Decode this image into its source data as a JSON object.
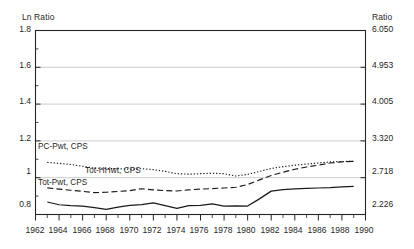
{
  "axes": {
    "left_title": "Ln Ratio",
    "right_title": "Ratio",
    "left_ticks": [
      "1.8",
      "1.6",
      "1.4",
      "1.2",
      "1",
      "0.8"
    ],
    "right_ticks": [
      "6.050",
      "4.953",
      "4.005",
      "3.320",
      "2.718",
      "2.226"
    ],
    "x_ticks": [
      "1962",
      "1964",
      "1966",
      "1968",
      "1970",
      "1972",
      "1974",
      "1976",
      "1978",
      "1980",
      "1982",
      "1984",
      "1986",
      "1988",
      "1990"
    ]
  },
  "series_labels": {
    "pc_pwt": "PC-Pwt, CPS",
    "tot_hhwt": "Tot-HHwt, CPS",
    "tot_pwt": "Tot-Pwt, CPS"
  },
  "chart_data": {
    "type": "line",
    "title": "",
    "xlabel": "",
    "ylabel": "Ln Ratio",
    "y2label": "Ratio",
    "xlim": [
      1962,
      1990
    ],
    "ylim": [
      0.8,
      1.8
    ],
    "y2lim": [
      2.226,
      6.05
    ],
    "grid": true,
    "legend_position": "inline-annotations",
    "y_ticks": [
      0.8,
      1.0,
      1.2,
      1.4,
      1.6,
      1.8
    ],
    "y2_ticks": [
      2.226,
      2.718,
      3.32,
      4.005,
      4.953,
      6.05
    ],
    "x_ticks": [
      1962,
      1964,
      1966,
      1968,
      1970,
      1972,
      1974,
      1976,
      1978,
      1980,
      1982,
      1984,
      1986,
      1988,
      1990
    ],
    "x": [
      1963,
      1964,
      1965,
      1966,
      1967,
      1968,
      1969,
      1970,
      1971,
      1972,
      1973,
      1974,
      1975,
      1976,
      1977,
      1978,
      1979,
      1980,
      1981,
      1982,
      1983,
      1984,
      1985,
      1986,
      1987,
      1988,
      1989
    ],
    "series": [
      {
        "name": "PC-Pwt, CPS",
        "style": "dotted",
        "values": [
          1.083,
          1.078,
          1.072,
          1.062,
          1.052,
          1.05,
          1.049,
          1.046,
          1.049,
          1.044,
          1.034,
          1.022,
          1.019,
          1.022,
          1.024,
          1.022,
          1.009,
          1.018,
          1.034,
          1.05,
          1.06,
          1.068,
          1.074,
          1.08,
          1.086,
          1.088,
          1.089
        ]
      },
      {
        "name": "Tot-HHwt, CPS",
        "style": "dashed",
        "values": [
          0.945,
          0.938,
          0.932,
          0.926,
          0.919,
          0.921,
          0.925,
          0.93,
          0.94,
          0.934,
          0.93,
          0.928,
          0.934,
          0.938,
          0.941,
          0.944,
          0.948,
          0.963,
          0.988,
          1.012,
          1.03,
          1.046,
          1.058,
          1.068,
          1.08,
          1.086,
          1.089
        ]
      },
      {
        "name": "Tot-Pwt, CPS",
        "style": "solid",
        "values": [
          0.868,
          0.853,
          0.848,
          0.845,
          0.838,
          0.828,
          0.84,
          0.849,
          0.854,
          0.863,
          0.848,
          0.833,
          0.848,
          0.85,
          0.858,
          0.846,
          0.847,
          0.846,
          0.885,
          0.927,
          0.935,
          0.939,
          0.942,
          0.944,
          0.946,
          0.95,
          0.953
        ]
      }
    ]
  }
}
